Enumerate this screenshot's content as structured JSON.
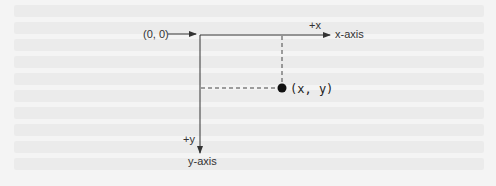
{
  "diagram": {
    "origin_label": "(0, 0)",
    "plus_x_label": "+x",
    "x_axis_label": "x-axis",
    "plus_y_label": "+y",
    "y_axis_label": "y-axis",
    "point_label": "(x, y)"
  },
  "colors": {
    "line": "#333333",
    "point": "#111111"
  }
}
